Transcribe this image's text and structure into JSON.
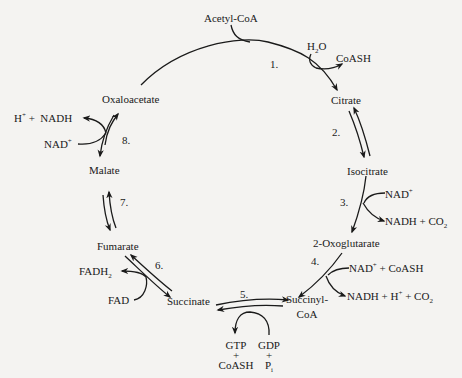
{
  "metabolites": {
    "acetyl_coa": "Acetyl-CoA",
    "citrate": "Citrate",
    "isocitrate": "Isocitrate",
    "oxoglutarate": "2-Oxoglutarate",
    "succinyl_coa_1": "Succinyl-",
    "succinyl_coa_2": "CoA",
    "succinate": "Succinate",
    "fumarate": "Fumarate",
    "malate": "Malate",
    "oxaloacetate": "Oxaloacetate"
  },
  "steps": [
    "1.",
    "2.",
    "3.",
    "4.",
    "5.",
    "6.",
    "7.",
    "8."
  ],
  "cofactors": {
    "step1_in": "H2O",
    "step1_out": "CoASH",
    "step3_in": "NAD+",
    "step3_out": "NADH + CO2",
    "step4_in": "NAD+ + CoASH",
    "step4_out": "NADH + H+ + CO2",
    "step5_in_1": "GDP",
    "step5_in_2": "+",
    "step5_in_3": "Pi",
    "step5_out_1": "GTP",
    "step5_out_2": "+",
    "step5_out_3": "CoASH",
    "step6_in": "FAD",
    "step6_out": "FADH2",
    "step8_in": "NAD+",
    "step8_out": "H+ + NADH"
  },
  "colors": {
    "ink": "#1a1a1a",
    "paper": "#f4f3f1"
  }
}
